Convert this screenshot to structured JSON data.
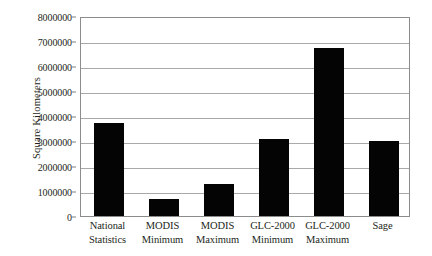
{
  "chart_data": {
    "type": "bar",
    "title": "",
    "subtitle": "",
    "xlabel": "",
    "ylabel": "Square Kilometers",
    "categories": [
      "National Statistics",
      "MODIS Minimum",
      "MODIS Maximum",
      "GLC-2000 Minimum",
      "GLC-2000 Maximum",
      "Sage"
    ],
    "category_lines": [
      [
        "National",
        "Statistics"
      ],
      [
        "MODIS",
        "Minimum"
      ],
      [
        "MODIS",
        "Maximum"
      ],
      [
        "GLC-2000",
        "Minimum"
      ],
      [
        "GLC-2000",
        "Maximum"
      ],
      [
        "Sage",
        ""
      ]
    ],
    "values": [
      3720000,
      680000,
      1280000,
      3080000,
      6720000,
      3020000
    ],
    "ylim": [
      0,
      8000000
    ],
    "ytick_values": [
      0,
      1000000,
      2000000,
      3000000,
      4000000,
      5000000,
      6000000,
      7000000,
      8000000
    ],
    "ytick_labels": [
      "0",
      "1000000",
      "2000000",
      "3000000",
      "4000000",
      "5000000",
      "6000000",
      "7000000",
      "8000000"
    ],
    "grid": "horizontal",
    "legend": "none",
    "bar_color": "#040404",
    "grid_color": "#a9a9a9",
    "frame_color": "#8c8c8c",
    "background_color": "#ffffff",
    "text_color": "#231f20"
  }
}
